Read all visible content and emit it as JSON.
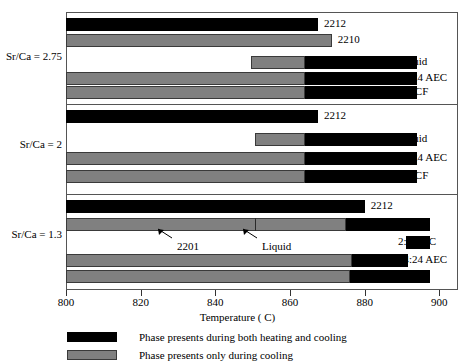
{
  "chart_data": {
    "type": "bar",
    "title": "",
    "xlabel": "Temperature ( C)",
    "ylabel": "",
    "xlim": [
      800,
      905
    ],
    "xticks": [
      800,
      820,
      840,
      860,
      880,
      900
    ],
    "xticklabels": [
      "800",
      "820",
      "840",
      "860",
      "880",
      "900"
    ],
    "grid": false,
    "orientation": "horizontal",
    "legend_position": "below-axis",
    "legend": [
      {
        "key": "both",
        "color": "#000000",
        "label": "Phase presents during both heating and cooling"
      },
      {
        "key": "cooling",
        "color": "#808080",
        "label": "Phase presents only during  cooling"
      }
    ],
    "groups": [
      {
        "label": "Sr/Ca = 2.75",
        "bars": [
          {
            "name": "2212",
            "right_label": "",
            "value_label": "2212",
            "segments": [
              {
                "type": "both",
                "start": 800,
                "end": 867.5
              }
            ]
          },
          {
            "name": "2210",
            "right_label": "",
            "value_label": "2210",
            "segments": [
              {
                "type": "cooling",
                "start": 800,
                "end": 871.2
              }
            ]
          },
          {
            "name": "Liquid",
            "right_label": "Liquid",
            "value_label": "",
            "segments": [
              {
                "type": "cooling",
                "start": 849.5,
                "end": 864.0
              },
              {
                "type": "both",
                "start": 864.0,
                "end": 894.0
              }
            ]
          },
          {
            "name": "14:24 AEC",
            "right_label": "14:24 AEC",
            "value_label": "",
            "segments": [
              {
                "type": "cooling",
                "start": 800,
                "end": 864.0
              },
              {
                "type": "both",
                "start": 864.0,
                "end": 894.0
              }
            ]
          },
          {
            "name": "2:4 CF",
            "right_label": "2:4 CF",
            "value_label": "",
            "segments": [
              {
                "type": "cooling",
                "start": 800,
                "end": 864.0
              },
              {
                "type": "both",
                "start": 864.0,
                "end": 894.0
              }
            ]
          }
        ],
        "annotations": []
      },
      {
        "label": "Sr/Ca = 2",
        "bars": [
          {
            "name": "2212",
            "right_label": "",
            "value_label": "2212",
            "segments": [
              {
                "type": "both",
                "start": 800,
                "end": 867.5
              }
            ]
          },
          {
            "name": "Liquid",
            "right_label": "Liquid",
            "value_label": "",
            "segments": [
              {
                "type": "cooling",
                "start": 850.5,
                "end": 864.0
              },
              {
                "type": "both",
                "start": 864.0,
                "end": 894.0
              }
            ]
          },
          {
            "name": "14:24 AEC",
            "right_label": "14:24 AEC",
            "value_label": "",
            "segments": [
              {
                "type": "cooling",
                "start": 800,
                "end": 864.0
              },
              {
                "type": "both",
                "start": 864.0,
                "end": 894.0
              }
            ]
          },
          {
            "name": "2:4 CF",
            "right_label": "2:4 CF",
            "value_label": "",
            "segments": [
              {
                "type": "cooling",
                "start": 800,
                "end": 864.0
              },
              {
                "type": "both",
                "start": 864.0,
                "end": 894.0
              }
            ]
          }
        ],
        "annotations": []
      },
      {
        "label": "Sr/Ca = 1.3",
        "bars": [
          {
            "name": "2212",
            "right_label": "",
            "value_label": "2212",
            "segments": [
              {
                "type": "both",
                "start": 800,
                "end": 880.0
              }
            ]
          },
          {
            "name": "Liquid",
            "right_label": "Liquid",
            "value_label": "",
            "segments": [
              {
                "type": "cooling",
                "start": 800,
                "end": 875.0
              },
              {
                "type": "both",
                "start": 875.0,
                "end": 897.5
              }
            ],
            "inner_divider": 850.5
          },
          {
            "name": "2:1 AEC",
            "right_label": "2:1 AEC",
            "value_label": "",
            "segments": [
              {
                "type": "both",
                "start": 891.0,
                "end": 897.5
              }
            ]
          },
          {
            "name": "14:24 AEC",
            "right_label": "14:24 AEC",
            "value_label": "",
            "segments": [
              {
                "type": "cooling",
                "start": 800,
                "end": 876.5
              },
              {
                "type": "both",
                "start": 876.5,
                "end": 891.5
              }
            ]
          },
          {
            "name": "2:4 CF",
            "right_label": "2:4 CF",
            "value_label": "",
            "segments": [
              {
                "type": "cooling",
                "start": 800,
                "end": 876.0
              },
              {
                "type": "both",
                "start": 876.0,
                "end": 897.5
              }
            ]
          }
        ],
        "annotations": [
          {
            "text": "2201",
            "x": 177,
            "y": 240,
            "arrow_x1": 172,
            "arrow_y1": 238,
            "arrow_x2": 158,
            "arrow_y2": 229
          },
          {
            "text": "Liquid",
            "x": 262,
            "y": 240,
            "arrow_x1": 257,
            "arrow_y1": 238,
            "arrow_x2": 243,
            "arrow_y2": 229
          }
        ]
      }
    ]
  }
}
